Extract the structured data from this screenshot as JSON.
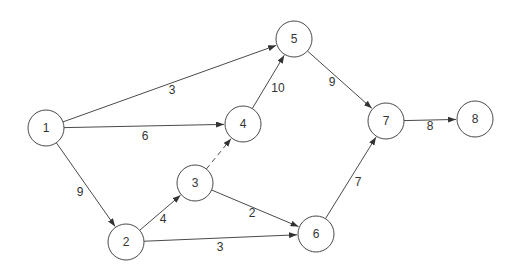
{
  "diagram": {
    "type": "directed-network",
    "node_radius": 18,
    "colors": {
      "stroke": "#4a4a4a",
      "text": "#333333",
      "background": "#ffffff"
    },
    "nodes": [
      {
        "id": "1",
        "label": "1",
        "x": 46,
        "y": 128
      },
      {
        "id": "2",
        "label": "2",
        "x": 126,
        "y": 242
      },
      {
        "id": "3",
        "label": "3",
        "x": 195,
        "y": 183
      },
      {
        "id": "4",
        "label": "4",
        "x": 243,
        "y": 124
      },
      {
        "id": "5",
        "label": "5",
        "x": 294,
        "y": 39
      },
      {
        "id": "6",
        "label": "6",
        "x": 316,
        "y": 234
      },
      {
        "id": "7",
        "label": "7",
        "x": 386,
        "y": 121
      },
      {
        "id": "8",
        "label": "8",
        "x": 475,
        "y": 119
      }
    ],
    "edges": [
      {
        "from": "1",
        "to": "5",
        "label": "3",
        "lx": 172,
        "ly": 90,
        "dashed": false
      },
      {
        "from": "1",
        "to": "4",
        "label": "6",
        "lx": 145,
        "ly": 136,
        "dashed": false
      },
      {
        "from": "1",
        "to": "2",
        "label": "9",
        "lx": 80,
        "ly": 192,
        "dashed": false
      },
      {
        "from": "2",
        "to": "3",
        "label": "4",
        "lx": 163,
        "ly": 219,
        "dashed": false
      },
      {
        "from": "2",
        "to": "6",
        "label": "3",
        "lx": 220,
        "ly": 247,
        "dashed": false
      },
      {
        "from": "3",
        "to": "4",
        "label": "",
        "lx": 0,
        "ly": 0,
        "dashed": true
      },
      {
        "from": "3",
        "to": "6",
        "label": "2",
        "lx": 252,
        "ly": 213,
        "dashed": false
      },
      {
        "from": "4",
        "to": "5",
        "label": "10",
        "lx": 278,
        "ly": 88,
        "dashed": false
      },
      {
        "from": "5",
        "to": "7",
        "label": "9",
        "lx": 332,
        "ly": 82,
        "dashed": false
      },
      {
        "from": "6",
        "to": "7",
        "label": "7",
        "lx": 358,
        "ly": 182,
        "dashed": false
      },
      {
        "from": "7",
        "to": "8",
        "label": "8",
        "lx": 430,
        "ly": 126,
        "dashed": false
      }
    ]
  }
}
